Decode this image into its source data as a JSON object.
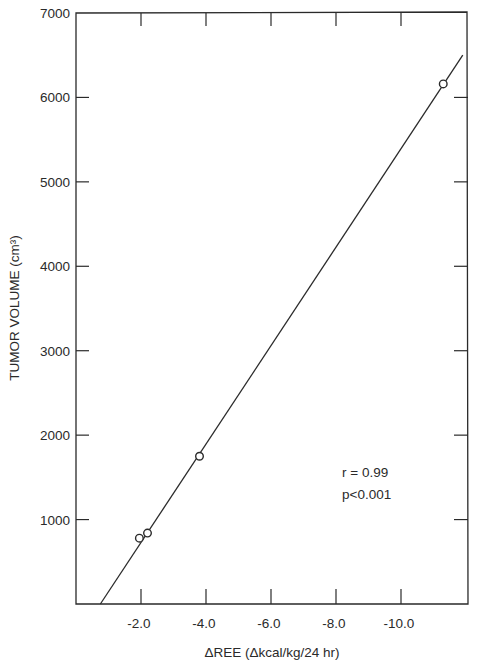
{
  "chart_data": {
    "type": "scatter",
    "title": "",
    "xlabel": "ΔREE (Δkcal/kg/24 hr)",
    "ylabel": "TUMOR VOLUME (cm³)",
    "xlim": [
      0,
      -12.0
    ],
    "ylim": [
      0,
      7000
    ],
    "x_ticks": [
      -2.0,
      -4.0,
      -6.0,
      -8.0,
      -10.0
    ],
    "x_tick_labels": [
      "-2.0",
      "-4.0",
      "-6.0",
      "-8.0",
      "-10.0"
    ],
    "y_ticks": [
      1000,
      2000,
      3000,
      4000,
      5000,
      6000,
      7000
    ],
    "y_tick_labels": [
      "1000",
      "2000",
      "3000",
      "4000",
      "5000",
      "6000",
      "7000"
    ],
    "grid": false,
    "legend": null,
    "series": [
      {
        "name": "Patients",
        "marker": "open-circle",
        "points": [
          {
            "x": -1.95,
            "y": 780
          },
          {
            "x": -2.2,
            "y": 840
          },
          {
            "x": -3.8,
            "y": 1750
          },
          {
            "x": -11.3,
            "y": 6160
          }
        ]
      }
    ],
    "regression_line": {
      "points": [
        {
          "x": -0.75,
          "y": 0
        },
        {
          "x": -11.9,
          "y": 6500
        }
      ]
    },
    "annotations": [
      "r = 0.99",
      "p<0.001"
    ]
  },
  "ui": {
    "annotation_r": "r = 0.99",
    "annotation_p": "p<0.001",
    "xlabel": "ΔREE (Δkcal/kg/24 hr)",
    "ylabel": "TUMOR VOLUME (cm³)"
  },
  "colors": {
    "ink": "#2a2a2a",
    "background": "#ffffff"
  }
}
